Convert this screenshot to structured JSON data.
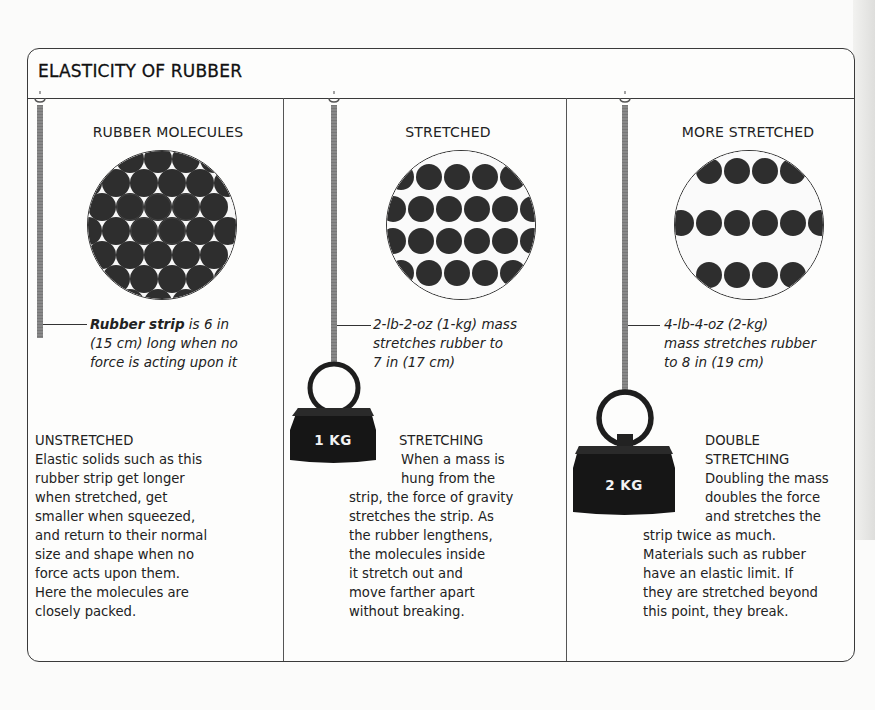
{
  "title": "ELASTICITY OF RUBBER",
  "colors": {
    "border": "#3a3a3a",
    "molecule": "#2e2e2e",
    "strip": "#808080",
    "weight": "#161616",
    "weight_text": "#f2f2f2",
    "background": "#fdfdfc"
  },
  "columns": [
    {
      "heading": "RUBBER MOLECULES",
      "molecule_arrangement": "closely-packed",
      "caption_bold": "Rubber strip",
      "caption_rest_1": " is 6 in",
      "caption_line_2": "(15 cm) long when no",
      "caption_line_3": "force is acting upon it",
      "section_heading": "UNSTRETCHED",
      "body_lines": [
        "Elastic solids such as this",
        "rubber strip get longer",
        "when stretched, get",
        "smaller when squeezed,",
        "and return to their normal",
        "size and shape when no",
        "force acts upon them.",
        "Here the molecules are",
        "closely packed."
      ]
    },
    {
      "heading": "STRETCHED",
      "molecule_arrangement": "rows",
      "caption_lines": [
        "2-lb-2-oz (1-kg) mass",
        "stretches rubber to",
        "7 in (17 cm)"
      ],
      "weight_label": "1 KG",
      "section_heading": "STRETCHING",
      "body_lines_indented": [
        "When a mass is",
        "hung from the"
      ],
      "body_lines": [
        "strip, the force of gravity",
        "stretches the strip. As",
        "the rubber lengthens,",
        "the molecules inside",
        "it stretch out and",
        "move farther apart",
        "without breaking."
      ]
    },
    {
      "heading": "MORE STRETCHED",
      "molecule_arrangement": "widely-spaced-rows",
      "caption_lines": [
        "4-lb-4-oz (2-kg)",
        "mass stretches rubber",
        "to 8 in (19 cm)"
      ],
      "weight_label": "2 KG",
      "section_heading_lines": [
        "DOUBLE",
        "STRETCHING"
      ],
      "body_lines_indented": [
        "Doubling the mass",
        "doubles the force",
        "and stretches the"
      ],
      "body_lines": [
        "strip twice as much.",
        "Materials such as rubber",
        "have an elastic limit. If",
        "they are stretched beyond",
        "this point, they break."
      ]
    }
  ]
}
